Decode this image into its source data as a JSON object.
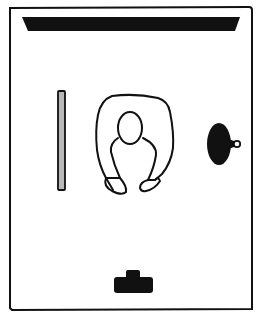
{
  "diagram": {
    "type": "floor-plan-top-view",
    "elements": [
      {
        "id": "room-frame",
        "label": "room outline"
      },
      {
        "id": "top-bar",
        "label": "wall-mounted bar / screen"
      },
      {
        "id": "side-panel",
        "label": "vertical panel"
      },
      {
        "id": "person",
        "label": "person seen from above"
      },
      {
        "id": "lamp",
        "label": "round object with knob"
      },
      {
        "id": "bottom-object",
        "label": "small T-shaped object"
      }
    ]
  },
  "colors": {
    "ink": "#111111",
    "panel_fill": "#b8b8b8",
    "background": "#ffffff"
  }
}
